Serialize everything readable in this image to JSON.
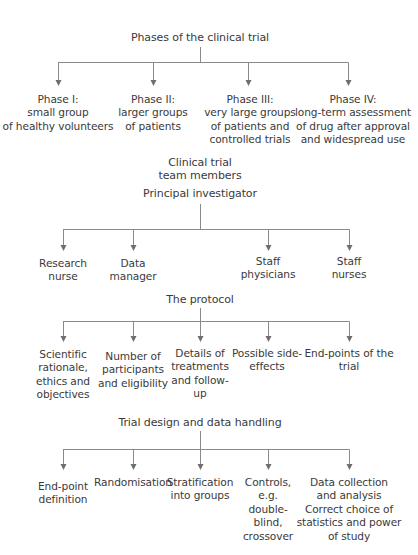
{
  "sections": [
    {
      "title": [
        "Phases of the clinical trial"
      ],
      "children": [
        {
          "lines": [
            "Phase I:",
            "small group",
            "of healthy volunteers"
          ]
        },
        {
          "lines": [
            "Phase II:",
            "larger groups",
            "of patients"
          ]
        },
        {
          "lines": [
            "Phase III:",
            "very large groups",
            "of patients and",
            "controlled trials"
          ]
        },
        {
          "lines": [
            "Phase IV:",
            "long-term assessment",
            "of drug after approval",
            "and widespread use"
          ]
        }
      ]
    },
    {
      "title": [
        "Clinical trial",
        "team members"
      ],
      "subtitle": "Principal investigator",
      "children": [
        {
          "lines": [
            "Research",
            "nurse"
          ]
        },
        {
          "lines": [
            "Data",
            "manager"
          ]
        },
        {
          "lines": [
            "Staff",
            "physicians"
          ]
        },
        {
          "lines": [
            "Staff",
            "nurses"
          ]
        }
      ]
    },
    {
      "title": [
        "The protocol"
      ],
      "children": [
        {
          "lines": [
            "Scientific",
            "rationale,",
            "ethics and",
            "objectives"
          ]
        },
        {
          "lines": [
            "Number of",
            "participants",
            "and eligibility"
          ]
        },
        {
          "lines": [
            "Details of",
            "treatments",
            "and follow-",
            "up"
          ]
        },
        {
          "lines": [
            "Possible side-",
            "effects"
          ]
        },
        {
          "lines": [
            "End-points of the",
            "trial"
          ]
        }
      ]
    },
    {
      "title": [
        "Trial design and data handling"
      ],
      "children": [
        {
          "lines": [
            "End-point",
            "definition"
          ]
        },
        {
          "lines": [
            "Randomisation"
          ]
        },
        {
          "lines": [
            "Stratification",
            "into groups"
          ]
        },
        {
          "lines": [
            "Controls,",
            "e.g.",
            "double-",
            "blind,",
            "crossover"
          ]
        },
        {
          "lines": [
            "Data collection",
            "and analysis",
            "Correct choice of",
            "statistics and power",
            "of study"
          ]
        }
      ]
    }
  ],
  "colors": {
    "line": "#8a8a8a",
    "arrow": "#6f6f6f",
    "text": "#3a3a3a"
  }
}
